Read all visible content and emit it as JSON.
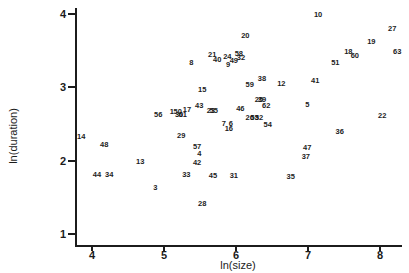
{
  "chart_data": {
    "type": "scatter",
    "title": "",
    "xlabel": "ln(size)",
    "ylabel": "ln(duration)",
    "xlim": [
      3.76,
      8.3
    ],
    "ylim": [
      0.95,
      4.08
    ],
    "x_ticks": [
      4,
      5,
      6,
      7,
      8
    ],
    "y_ticks": [
      1,
      2,
      3,
      4
    ],
    "grid": false,
    "legend": "none",
    "marker_style": "case-number-text-labels",
    "points": [
      {
        "label": "10",
        "x": 7.14,
        "y": 3.99
      },
      {
        "label": "27",
        "x": 8.17,
        "y": 3.8
      },
      {
        "label": "20",
        "x": 6.13,
        "y": 3.7
      },
      {
        "label": "19",
        "x": 7.88,
        "y": 3.62
      },
      {
        "label": "18",
        "x": 7.56,
        "y": 3.48
      },
      {
        "label": "60",
        "x": 7.65,
        "y": 3.43
      },
      {
        "label": "63",
        "x": 8.24,
        "y": 3.48
      },
      {
        "label": "51",
        "x": 7.38,
        "y": 3.33
      },
      {
        "label": "21",
        "x": 5.67,
        "y": 3.44
      },
      {
        "label": "24",
        "x": 5.88,
        "y": 3.41
      },
      {
        "label": "58",
        "x": 6.04,
        "y": 3.45
      },
      {
        "label": "32",
        "x": 6.07,
        "y": 3.4
      },
      {
        "label": "40",
        "x": 5.74,
        "y": 3.37
      },
      {
        "label": "49",
        "x": 5.97,
        "y": 3.36
      },
      {
        "label": "9",
        "x": 5.89,
        "y": 3.3
      },
      {
        "label": "8",
        "x": 5.38,
        "y": 3.33
      },
      {
        "label": "15",
        "x": 5.53,
        "y": 2.96
      },
      {
        "label": "38",
        "x": 6.36,
        "y": 3.11
      },
      {
        "label": "59",
        "x": 6.19,
        "y": 3.03
      },
      {
        "label": "12",
        "x": 6.63,
        "y": 3.04
      },
      {
        "label": "41",
        "x": 7.1,
        "y": 3.09
      },
      {
        "label": "5",
        "x": 6.99,
        "y": 2.76
      },
      {
        "label": "46",
        "x": 6.06,
        "y": 2.7
      },
      {
        "label": "25",
        "x": 6.32,
        "y": 2.83
      },
      {
        "label": "39",
        "x": 6.36,
        "y": 2.83
      },
      {
        "label": "62",
        "x": 6.42,
        "y": 2.74
      },
      {
        "label": "43",
        "x": 5.49,
        "y": 2.74
      },
      {
        "label": "17",
        "x": 5.32,
        "y": 2.69
      },
      {
        "label": "1",
        "x": 5.11,
        "y": 2.66
      },
      {
        "label": "50",
        "x": 5.19,
        "y": 2.66
      },
      {
        "label": "30",
        "x": 5.21,
        "y": 2.62
      },
      {
        "label": "61",
        "x": 5.26,
        "y": 2.62
      },
      {
        "label": "56",
        "x": 4.92,
        "y": 2.62
      },
      {
        "label": "23",
        "x": 5.65,
        "y": 2.68
      },
      {
        "label": "55",
        "x": 5.69,
        "y": 2.68
      },
      {
        "label": "26",
        "x": 6.19,
        "y": 2.58
      },
      {
        "label": "53",
        "x": 6.26,
        "y": 2.58
      },
      {
        "label": "52",
        "x": 6.32,
        "y": 2.58
      },
      {
        "label": "7",
        "x": 5.83,
        "y": 2.5
      },
      {
        "label": "6",
        "x": 5.93,
        "y": 2.5
      },
      {
        "label": "16",
        "x": 5.9,
        "y": 2.43
      },
      {
        "label": "54",
        "x": 6.44,
        "y": 2.49
      },
      {
        "label": "22",
        "x": 8.03,
        "y": 2.61
      },
      {
        "label": "36",
        "x": 7.44,
        "y": 2.39
      },
      {
        "label": "14",
        "x": 3.85,
        "y": 2.32
      },
      {
        "label": "48",
        "x": 4.17,
        "y": 2.21
      },
      {
        "label": "29",
        "x": 5.24,
        "y": 2.34
      },
      {
        "label": "57",
        "x": 5.46,
        "y": 2.19
      },
      {
        "label": "4",
        "x": 5.49,
        "y": 2.09
      },
      {
        "label": "42",
        "x": 5.46,
        "y": 1.97
      },
      {
        "label": "13",
        "x": 4.67,
        "y": 1.98
      },
      {
        "label": "44",
        "x": 4.07,
        "y": 1.8
      },
      {
        "label": "34",
        "x": 4.24,
        "y": 1.8
      },
      {
        "label": "33",
        "x": 5.31,
        "y": 1.8
      },
      {
        "label": "45",
        "x": 5.68,
        "y": 1.79
      },
      {
        "label": "31",
        "x": 5.97,
        "y": 1.79
      },
      {
        "label": "35",
        "x": 6.76,
        "y": 1.78
      },
      {
        "label": "47",
        "x": 6.99,
        "y": 2.17
      },
      {
        "label": "37",
        "x": 6.97,
        "y": 2.05
      },
      {
        "label": "3",
        "x": 4.88,
        "y": 1.63
      },
      {
        "label": "28",
        "x": 5.53,
        "y": 1.41
      }
    ]
  },
  "colors": {
    "ink": "#1c1c1c",
    "background": "#ffffff"
  }
}
